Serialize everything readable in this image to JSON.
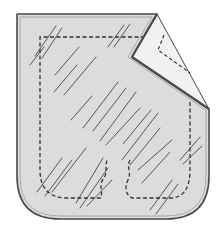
{
  "diagram": {
    "title": "Patch pocket with peeled-back corner",
    "width": 224,
    "height": 231,
    "colors": {
      "background": "#ffffff",
      "patch_fill": "#dcdcdc",
      "flap_fill": "#f1f1f1",
      "outline": "#4a4a4a",
      "outline_inner": "#9a9a9a",
      "dash": "#333333",
      "hatch": "#555555"
    },
    "patch_outline": "M17,14 L157,14 L132,57 L209,109 L209,176 Q209,219 166,219 L60,219 Q17,219 17,176 Z",
    "patch_outline_inner": "M20,17 L152,17 L128,57 L206,110 L206,176 Q206,216 166,216 L60,216 Q20,216 20,176 Z",
    "flap": "M157,14 L132,57 L209,109 Z",
    "flap_fold_edge": "M157,14 L132,57 L209,109",
    "stitch_main": "M145,37 L40,37 L40,170 Q40,198 68,198 L101,198 C103,190 98,185 104,178 C108,172 104,165 108,158 M130,160 C126,168 132,172 128,180 C124,188 126,195 132,198 L170,198 Q190,198 190,170 L190,100",
    "stitch_flap": "M164,35 L158,50 L190,73",
    "hatch_lines": [
      [
        35,
        56,
        56,
        26
      ],
      [
        42,
        58,
        62,
        28
      ],
      [
        30,
        65,
        44,
        47
      ],
      [
        108,
        47,
        124,
        25
      ],
      [
        114,
        47,
        130,
        24
      ],
      [
        55,
        75,
        79,
        47
      ],
      [
        54,
        92,
        77,
        65
      ],
      [
        64,
        95,
        96,
        57
      ],
      [
        83,
        128,
        118,
        82
      ],
      [
        93,
        131,
        126,
        88
      ],
      [
        100,
        141,
        136,
        92
      ],
      [
        106,
        145,
        140,
        108
      ],
      [
        71,
        120,
        92,
        96
      ],
      [
        122,
        160,
        158,
        113
      ],
      [
        130,
        165,
        160,
        128
      ],
      [
        138,
        170,
        172,
        140
      ],
      [
        142,
        183,
        170,
        152
      ],
      [
        123,
        144,
        151,
        110
      ],
      [
        37,
        192,
        62,
        158
      ],
      [
        45,
        196,
        72,
        160
      ],
      [
        52,
        192,
        86,
        148
      ],
      [
        76,
        203,
        103,
        158
      ],
      [
        80,
        208,
        108,
        168
      ],
      [
        87,
        206,
        112,
        180
      ],
      [
        150,
        210,
        172,
        180
      ],
      [
        156,
        214,
        178,
        184
      ],
      [
        180,
        160,
        200,
        137
      ],
      [
        183,
        164,
        202,
        146
      ]
    ]
  }
}
